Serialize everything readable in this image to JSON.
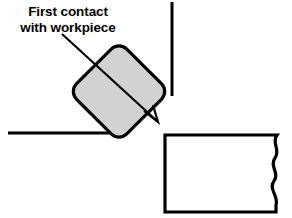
{
  "diagram": {
    "callout": {
      "line1": "First contact",
      "line2": "with workpiece",
      "text": "First contact with workpiece"
    },
    "colors": {
      "stroke": "#000000",
      "tool_fill": "#d2d2d2",
      "workpiece_fill": "#ffffff",
      "background": "#ffffff"
    },
    "shapes": {
      "tool": {
        "name": "rotated-square-tool",
        "rotation_degrees": 45,
        "corner_radius": 10,
        "fill": "#d2d2d2",
        "stroke_width": 3.2
      },
      "workpiece": {
        "name": "workpiece-block",
        "fill": "#ffffff",
        "stroke_width": 3.2,
        "break_line": "wavy-s-break",
        "break_undulations": 3
      },
      "vertical_guide": {
        "name": "vertical-guide-line",
        "stroke_width": 3.0
      },
      "horizontal_guide": {
        "name": "horizontal-guide-line",
        "stroke_width": 3.0
      },
      "leader": {
        "name": "leader-arrow",
        "stroke_width": 2.2,
        "arrowhead": "open-v"
      }
    }
  }
}
